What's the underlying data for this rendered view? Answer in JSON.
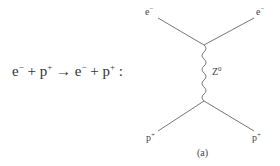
{
  "equation": {
    "lhs_particle1": "e",
    "lhs_particle1_charge": "−",
    "plus1": " + ",
    "lhs_particle2": "p",
    "lhs_particle2_charge": "+",
    "arrow": " → ",
    "rhs_particle1": "e",
    "rhs_particle1_charge": "−",
    "plus2": " + ",
    "rhs_particle2": "p",
    "rhs_particle2_charge": "+",
    "colon": " :"
  },
  "diagram": {
    "top_left": {
      "name": "e",
      "charge": "−"
    },
    "top_right": {
      "name": "e",
      "charge": "−"
    },
    "bottom_left": {
      "name": "p",
      "charge": "+"
    },
    "bottom_right": {
      "name": "p",
      "charge": "+"
    },
    "propagator": {
      "name": "Z",
      "superscript": "0"
    },
    "caption": "(a)"
  },
  "colors": {
    "line": "#666666",
    "text": "#333333"
  }
}
